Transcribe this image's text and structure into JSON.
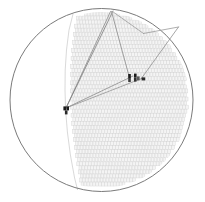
{
  "figure": {
    "title": "",
    "caption": "",
    "width": 205,
    "height": 202,
    "background_color": "#ffffff"
  },
  "chart_data": {
    "type": "scatter",
    "subtitle": "Transverse cross-section view with reconstructed tracks",
    "xlabel": "",
    "ylabel": "",
    "grid": false,
    "legend_position": "none",
    "detector": {
      "shape": "circle",
      "center_x": 101.5,
      "center_y": 100.0,
      "radius": 91.5,
      "outline_color": "#6b6b6b",
      "outline_width": 0.9,
      "fill_color": "#ffffff"
    },
    "inner_boundary": {
      "description": "inner light arc marking inner edge of cell volume",
      "color": "#cfcfcf",
      "width": 0.8,
      "path_points": [
        [
          73.0,
          14.0
        ],
        [
          69.0,
          30.0
        ],
        [
          66.5,
          50.0
        ],
        [
          65.2,
          70.0
        ],
        [
          65.0,
          90.0
        ],
        [
          65.6,
          110.0
        ],
        [
          67.4,
          132.0
        ],
        [
          70.4,
          155.0
        ],
        [
          74.6,
          178.0
        ],
        [
          77.6,
          190.0
        ]
      ]
    },
    "cell_array": {
      "description": "dense array of rectangular drift cells filling the right portion of the detector circle",
      "cell_width": 2.55,
      "cell_height": 3.95,
      "row_pitch": 4.05,
      "col_pitch": 2.95,
      "stagger": "brick",
      "stroke_color": "#d6d6d6",
      "fill_color": "#f4f4f4",
      "left_limit_curve": [
        [
          77.0,
          14.0
        ],
        [
          73.5,
          32.0
        ],
        [
          71.4,
          52.0
        ],
        [
          70.4,
          72.0
        ],
        [
          70.2,
          92.0
        ],
        [
          70.8,
          112.0
        ],
        [
          72.6,
          134.0
        ],
        [
          75.6,
          157.0
        ],
        [
          79.6,
          180.0
        ]
      ],
      "clip_to_detector": true,
      "clip_radius": 88.0,
      "column_count": 42,
      "row_count": 45
    },
    "vertex": {
      "label": "primary interaction vertex",
      "x": 66.0,
      "y": 108.0,
      "marker_color": "#1a1a1a"
    },
    "hit_markers": [
      {
        "x": 63.4,
        "y": 106.4,
        "w": 2.6,
        "h": 4.0,
        "color": "#1c1c1c"
      },
      {
        "x": 66.4,
        "y": 106.4,
        "w": 2.6,
        "h": 4.0,
        "color": "#1c1c1c"
      },
      {
        "x": 64.9,
        "y": 110.4,
        "w": 2.6,
        "h": 4.0,
        "color": "#2a2a2a"
      },
      {
        "x": 128.2,
        "y": 74.0,
        "w": 2.6,
        "h": 4.0,
        "color": "#1c1c1c"
      },
      {
        "x": 128.2,
        "y": 78.0,
        "w": 2.6,
        "h": 4.0,
        "color": "#3a3a3a"
      },
      {
        "x": 134.0,
        "y": 73.6,
        "w": 2.6,
        "h": 4.0,
        "color": "#1c1c1c"
      },
      {
        "x": 134.0,
        "y": 77.6,
        "w": 2.6,
        "h": 4.0,
        "color": "#303030"
      },
      {
        "x": 137.0,
        "y": 76.4,
        "w": 2.6,
        "h": 4.0,
        "color": "#5a5a5a"
      },
      {
        "x": 141.6,
        "y": 77.4,
        "w": 3.6,
        "h": 3.0,
        "color": "#2a2a2a"
      }
    ],
    "tracks": [
      {
        "name": "track-1",
        "from_x": 66.0,
        "from_y": 108.0,
        "to_x": 110.5,
        "to_y": 11.5,
        "color": "#8a8a8a",
        "width": 0.8
      },
      {
        "name": "track-2",
        "from_x": 66.0,
        "from_y": 108.0,
        "to_x": 113.0,
        "to_y": 11.0,
        "color": "#7d7d7d",
        "width": 0.8
      },
      {
        "name": "track-3",
        "from_x": 66.0,
        "from_y": 108.0,
        "to_x": 133.0,
        "to_y": 76.0,
        "color": "#8a8a8a",
        "width": 0.8
      },
      {
        "name": "track-4",
        "from_x": 66.0,
        "from_y": 108.0,
        "to_x": 143.0,
        "to_y": 78.0,
        "color": "#949494",
        "width": 0.8
      },
      {
        "name": "track-5",
        "from_x": 111.5,
        "from_y": 11.5,
        "to_x": 129.0,
        "to_y": 76.0,
        "color": "#8a8a8a",
        "width": 0.8
      },
      {
        "name": "track-6",
        "from_x": 112.5,
        "from_y": 11.5,
        "to_x": 143.5,
        "to_y": 33.5,
        "color": "#9a9a9a",
        "width": 0.8
      },
      {
        "name": "track-7",
        "from_x": 143.5,
        "from_y": 33.5,
        "to_x": 178.5,
        "to_y": 27.0,
        "color": "#9a9a9a",
        "width": 0.8
      },
      {
        "name": "track-8",
        "from_x": 178.5,
        "from_y": 27.0,
        "to_x": 141.0,
        "to_y": 79.0,
        "color": "#8f8f8f",
        "width": 0.8
      }
    ],
    "colors": {
      "detector_outline": "#6b6b6b",
      "cell_stroke": "#d6d6d6",
      "cell_fill": "#f4f4f4",
      "track": "#8a8a8a",
      "hit": "#1c1c1c",
      "background": "#ffffff"
    }
  }
}
